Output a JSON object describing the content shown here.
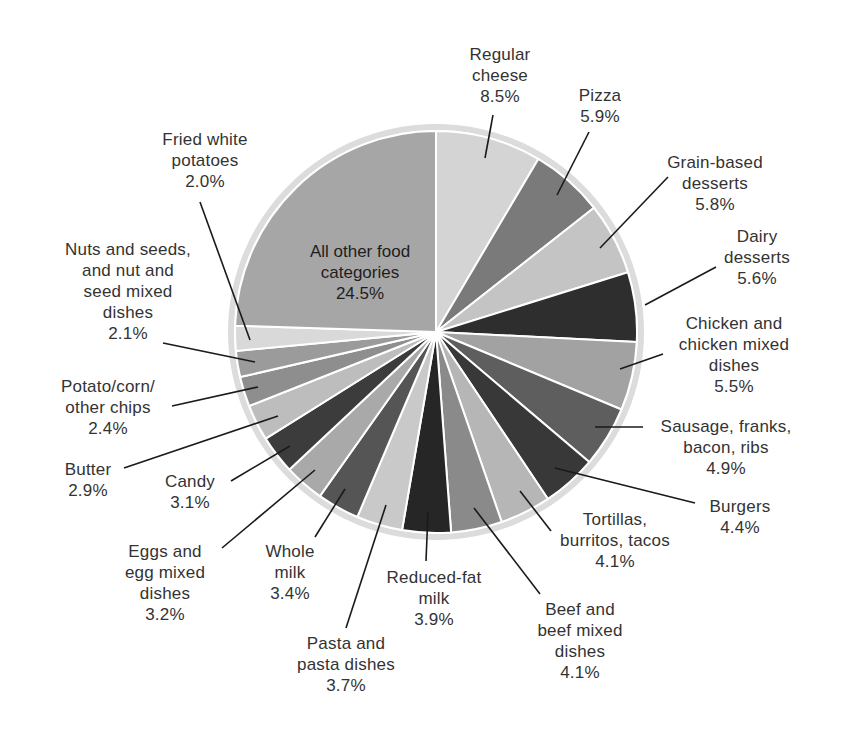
{
  "chart_data": {
    "type": "pie",
    "title": "",
    "start_angle_deg": 0,
    "direction": "clockwise",
    "slices": [
      {
        "label": "Regular cheese",
        "value": 8.5,
        "color": "#d4d4d4"
      },
      {
        "label": "Pizza",
        "value": 5.9,
        "color": "#7a7a7a"
      },
      {
        "label": "Grain-based desserts",
        "value": 5.8,
        "color": "#c4c4c4"
      },
      {
        "label": "Dairy desserts",
        "value": 5.6,
        "color": "#2e2e2e"
      },
      {
        "label": "Chicken and chicken mixed dishes",
        "value": 5.5,
        "color": "#a2a2a2"
      },
      {
        "label": "Sausage, franks, bacon, ribs",
        "value": 4.9,
        "color": "#5e5e5e"
      },
      {
        "label": "Burgers",
        "value": 4.4,
        "color": "#383838"
      },
      {
        "label": "Tortillas, burritos, tacos",
        "value": 4.1,
        "color": "#b6b6b6"
      },
      {
        "label": "Beef and beef mixed dishes",
        "value": 4.1,
        "color": "#8a8a8a"
      },
      {
        "label": "Reduced-fat milk",
        "value": 3.9,
        "color": "#262626"
      },
      {
        "label": "Pasta and pasta dishes",
        "value": 3.7,
        "color": "#c9c9c9"
      },
      {
        "label": "Whole milk",
        "value": 3.4,
        "color": "#555555"
      },
      {
        "label": "Eggs and egg mixed dishes",
        "value": 3.2,
        "color": "#a9a9a9"
      },
      {
        "label": "Candy",
        "value": 3.1,
        "color": "#3c3c3c"
      },
      {
        "label": "Butter",
        "value": 2.9,
        "color": "#bdbdbd"
      },
      {
        "label": "Potato/corn/other chips",
        "value": 2.4,
        "color": "#8e8e8e"
      },
      {
        "label": "Nuts and seeds, and nut and seed mixed dishes",
        "value": 2.1,
        "color": "#9b9b9b"
      },
      {
        "label": "Fried white potatoes",
        "value": 2.0,
        "color": "#d9d9d9"
      },
      {
        "label": "All other food categories",
        "value": 24.5,
        "color": "#a6a6a6"
      }
    ],
    "ring_color": "#dcdcdc",
    "separator_color": "#ffffff"
  },
  "labels": {
    "cheese": {
      "l1": "Regular",
      "l2": "cheese",
      "pct": "8.5%"
    },
    "pizza": {
      "l1": "Pizza",
      "pct": "5.9%"
    },
    "grain": {
      "l1": "Grain-based",
      "l2": "desserts",
      "pct": "5.8%"
    },
    "dairy": {
      "l1": "Dairy",
      "l2": "desserts",
      "pct": "5.6%"
    },
    "chicken": {
      "l1": "Chicken and",
      "l2": "chicken mixed",
      "l3": "dishes",
      "pct": "5.5%"
    },
    "sausage": {
      "l1": "Sausage, franks,",
      "l2": "bacon, ribs",
      "pct": "4.9%"
    },
    "burgers": {
      "l1": "Burgers",
      "pct": "4.4%"
    },
    "tortillas": {
      "l1": "Tortillas,",
      "l2": "burritos, tacos",
      "pct": "4.1%"
    },
    "beef": {
      "l1": "Beef and",
      "l2": "beef mixed",
      "l3": "dishes",
      "pct": "4.1%"
    },
    "reduced": {
      "l1": "Reduced-fat",
      "l2": "milk",
      "pct": "3.9%"
    },
    "pasta": {
      "l1": "Pasta and",
      "l2": "pasta dishes",
      "pct": "3.7%"
    },
    "whole": {
      "l1": "Whole",
      "l2": "milk",
      "pct": "3.4%"
    },
    "eggs": {
      "l1": "Eggs and",
      "l2": "egg mixed",
      "l3": "dishes",
      "pct": "3.2%"
    },
    "candy": {
      "l1": "Candy",
      "pct": "3.1%"
    },
    "butter": {
      "l1": "Butter",
      "pct": "2.9%"
    },
    "chips": {
      "l1": "Potato/corn/",
      "l2": "other chips",
      "pct": "2.4%"
    },
    "nuts": {
      "l1": "Nuts and seeds,",
      "l2": "and nut and",
      "l3": "seed mixed",
      "l4": "dishes",
      "pct": "2.1%"
    },
    "fried": {
      "l1": "Fried white",
      "l2": "potatoes",
      "pct": "2.0%"
    },
    "other": {
      "l1": "All other food",
      "l2": "categories",
      "pct": "24.5%"
    }
  }
}
